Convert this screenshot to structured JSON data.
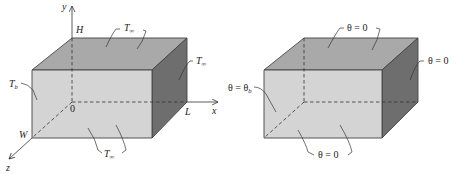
{
  "figure": {
    "left_box": {
      "axis_labels": {
        "x": "x",
        "y": "y",
        "z": "z"
      },
      "dimension_labels": {
        "height": "H",
        "length": "L",
        "width": "W",
        "origin": "0"
      },
      "boundary_labels": {
        "top": {
          "main": "T",
          "sub": "∞"
        },
        "right": {
          "main": "T",
          "sub": "∞"
        },
        "front": {
          "main": "T",
          "sub": "∞"
        },
        "base": {
          "main": "T",
          "sub": "b"
        }
      }
    },
    "right_box": {
      "boundary_labels": {
        "top": "θ = 0",
        "right": "θ = 0",
        "front": "θ = 0",
        "base_main": "θ = θ",
        "base_sub": "b"
      }
    },
    "colors": {
      "top_face": "#a9a9a9",
      "front_face": "#d4d4d4",
      "side_face": "#6e6e6e"
    }
  }
}
